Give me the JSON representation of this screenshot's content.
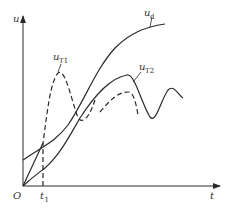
{
  "diagram": {
    "axes": {
      "y_label": "u",
      "x_label": "t",
      "origin_label": "O",
      "marker_label": "t",
      "marker_subscript": "1"
    },
    "curves": [
      {
        "name": "u_d",
        "label": "u",
        "subscript": "d",
        "style": "solid"
      },
      {
        "name": "u_T1",
        "label": "u",
        "subscript": "T1",
        "style": "dashed"
      },
      {
        "name": "u_T2",
        "label": "u",
        "subscript": "T2",
        "style": "solid"
      }
    ],
    "colors": {
      "stroke": "#2a2a2a",
      "background": "#ffffff"
    }
  }
}
